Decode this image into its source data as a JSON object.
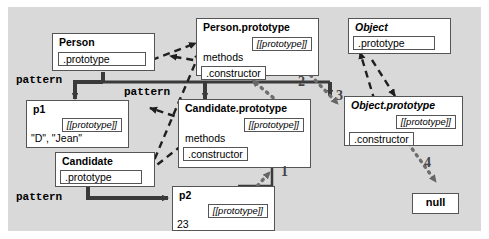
{
  "diagram": {
    "background_color": "#d9d9d9",
    "box_fill": "#ffffff",
    "box_border": "#555555",
    "proto_slot_label": "[[prototype]]"
  },
  "boxes": {
    "person": {
      "title": "Person",
      "slot": ".prototype"
    },
    "person_prototype": {
      "title": "Person.prototype",
      "proto_slot": "[[prototype]]",
      "methods": "methods",
      "constructor": ".constructor"
    },
    "object": {
      "title": "Object",
      "slot": ".prototype"
    },
    "object_prototype": {
      "title": "Object.prototype",
      "proto_slot": "[[prototype]]",
      "constructor": ".constructor"
    },
    "candidate": {
      "title": "Candidate",
      "slot": ".prototype"
    },
    "candidate_prototype": {
      "title": "Candidate.prototype",
      "proto_slot": "[[prototype]]",
      "methods": "methods",
      "constructor": ".constructor"
    },
    "p1": {
      "title": "p1",
      "proto_slot": "[[prototype]]",
      "value": "\"D\", \"Jean\""
    },
    "p2": {
      "title": "p2",
      "proto_slot": "[[prototype]]",
      "value": "23"
    },
    "null_box": {
      "label": "null"
    }
  },
  "pattern_labels": [
    {
      "text": "pattern"
    },
    {
      "text": "pattern"
    },
    {
      "text": "pattern"
    }
  ],
  "chain_numbers": [
    {
      "label": "1"
    },
    {
      "label": "2"
    },
    {
      "label": "3"
    },
    {
      "label": "4"
    }
  ]
}
